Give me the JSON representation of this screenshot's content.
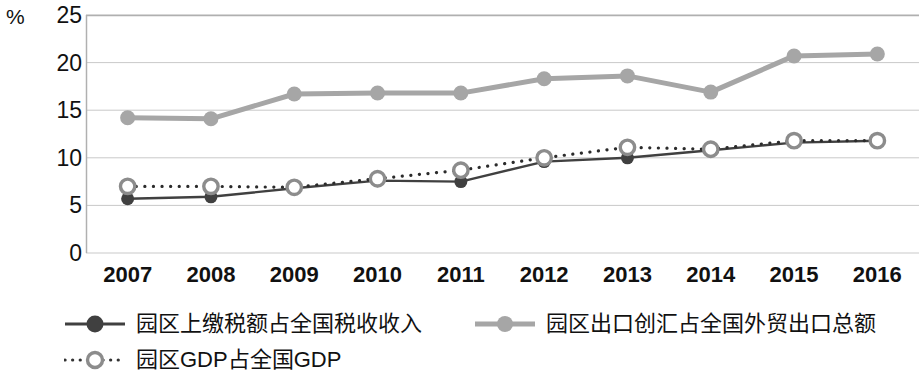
{
  "chart_data": {
    "type": "line",
    "title": "",
    "xlabel": "",
    "ylabel": "%",
    "unit_label": "%",
    "categories": [
      "2007",
      "2008",
      "2009",
      "2010",
      "2011",
      "2012",
      "2013",
      "2014",
      "2015",
      "2016"
    ],
    "ylim": [
      0,
      25
    ],
    "yticks": [
      0,
      5,
      10,
      15,
      20,
      25
    ],
    "ytick_labels": [
      "0",
      "5",
      "10",
      "15",
      "20",
      "25"
    ],
    "grid": "horizontal",
    "legend_position": "bottom",
    "series": [
      {
        "name": "园区上缴税额占全国税收收入",
        "color": "#404040",
        "line_style": "solid",
        "marker": "filled-circle",
        "values": [
          5.7,
          5.9,
          6.8,
          7.6,
          7.5,
          9.6,
          10.0,
          10.8,
          11.6,
          11.8
        ]
      },
      {
        "name": "园区出口创汇占全国外贸出口总额",
        "color": "#a6a6a6",
        "line_style": "solid",
        "marker": "filled-circle",
        "values": [
          14.2,
          14.1,
          16.7,
          16.8,
          16.8,
          18.3,
          18.6,
          16.9,
          20.7,
          20.9
        ]
      },
      {
        "name": "园区GDP占全国GDP",
        "color": "#595959",
        "line_style": "dotted",
        "marker": "hollow-circle",
        "values": [
          7.0,
          7.0,
          6.9,
          7.8,
          8.7,
          10.0,
          11.1,
          10.9,
          11.8,
          11.8
        ]
      }
    ]
  },
  "legend": {
    "items": [
      {
        "label": "园区上缴税额占全国税收收入"
      },
      {
        "label": "园区出口创汇占全国外贸出口总额"
      },
      {
        "label": "园区GDP占全国GDP"
      }
    ]
  },
  "colors": {
    "series_tax": "#404040",
    "series_export": "#a6a6a6",
    "series_gdp": "#595959",
    "gridline": "#c9c9c9",
    "axis": "#b0b0b0",
    "text": "#111111"
  }
}
